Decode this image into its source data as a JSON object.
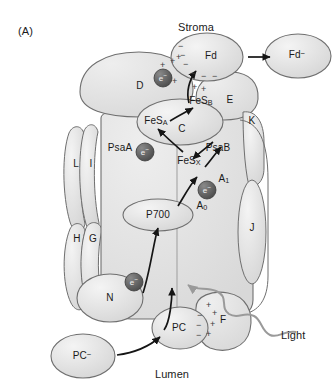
{
  "figure": {
    "panel_label": "(A)",
    "compartments": {
      "top": "Stroma",
      "bottom": "Lumen"
    },
    "light_label": "Light"
  },
  "mobile_carriers": [
    {
      "id": "fd",
      "label": "Fd",
      "charge": ""
    },
    {
      "id": "fd_minus",
      "label": "Fd",
      "charge": "−"
    },
    {
      "id": "pc",
      "label": "PC",
      "charge": ""
    },
    {
      "id": "pc_minus",
      "label": "PC",
      "charge": "−"
    }
  ],
  "core_subunits": [
    {
      "id": "psaa",
      "label": "PsaA"
    },
    {
      "id": "psab",
      "label": "PsaB"
    }
  ],
  "subunits": [
    {
      "id": "d",
      "label": "D"
    },
    {
      "id": "c",
      "label": "C"
    },
    {
      "id": "e",
      "label": "E"
    },
    {
      "id": "k",
      "label": "K"
    },
    {
      "id": "l",
      "label": "L"
    },
    {
      "id": "i",
      "label": "I"
    },
    {
      "id": "h",
      "label": "H"
    },
    {
      "id": "g",
      "label": "G"
    },
    {
      "id": "j",
      "label": "J"
    },
    {
      "id": "n",
      "label": "N"
    },
    {
      "id": "f",
      "label": "F"
    }
  ],
  "cofactors": [
    {
      "id": "fes_b",
      "base": "FeS",
      "sub": "B"
    },
    {
      "id": "fes_a",
      "base": "FeS",
      "sub": "A"
    },
    {
      "id": "fes_x",
      "base": "FeS",
      "sub": "X"
    },
    {
      "id": "a1",
      "base": "A",
      "sub": "1"
    },
    {
      "id": "a0",
      "base": "A",
      "sub": "0"
    },
    {
      "id": "p700",
      "base": "P700",
      "sub": ""
    }
  ],
  "electron_markers": [
    {
      "id": "e_stroma_top",
      "label": "e",
      "charge": "−"
    },
    {
      "id": "e_psaa_mid",
      "label": "e",
      "charge": "−"
    },
    {
      "id": "e_a0_right",
      "label": "e",
      "charge": "−"
    },
    {
      "id": "e_lumen_low",
      "label": "e",
      "charge": "−"
    }
  ],
  "charge_symbols": {
    "positive": "+",
    "negative": "−"
  },
  "colors": {
    "fill_light": "#e9e9e9",
    "fill_mid": "#dedede",
    "fill_dark": "#d2d2d2",
    "stroke": "#6f6f6f",
    "text": "#1a1a1a",
    "electron": "#555555",
    "light_arrow": "#9a9a9a"
  }
}
